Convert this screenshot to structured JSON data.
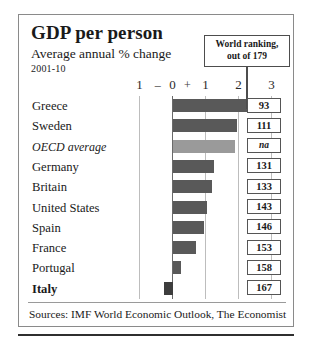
{
  "chart_data": {
    "type": "bar",
    "orientation": "horizontal",
    "title": "GDP per person",
    "subtitle": "Average annual % change",
    "period": "2001-10",
    "xlabel": "",
    "ylabel": "",
    "xlim": [
      -1,
      3
    ],
    "grid": true,
    "axis_ticks": [
      {
        "label": "1",
        "value": -1
      },
      {
        "label": "0",
        "value": 0
      },
      {
        "label": "1",
        "value": 1
      },
      {
        "label": "2",
        "value": 2
      },
      {
        "label": "3",
        "value": 3
      }
    ],
    "axis_signs": [
      {
        "label": "–",
        "value": -0.45
      },
      {
        "label": "+",
        "value": 0.45
      }
    ],
    "categories": [
      "Greece",
      "Sweden",
      "OECD average",
      "Germany",
      "Britain",
      "United States",
      "Spain",
      "France",
      "Portugal",
      "Italy"
    ],
    "values": [
      2.6,
      1.95,
      1.9,
      1.25,
      1.2,
      1.05,
      0.95,
      0.7,
      0.25,
      -0.25
    ],
    "ranking_label": "World ranking,\nout of 179",
    "rankings": [
      "93",
      "111",
      "na",
      "131",
      "133",
      "143",
      "146",
      "153",
      "158",
      "167"
    ],
    "source": "Sources: IMF World Economic Outlook, The Economist",
    "colors": {
      "bar_default": "#595959",
      "bar_highlight": "#9a9a9a",
      "bar_negative": "#3d3d3d",
      "frame": "#8a8a8a",
      "gridline": "#bdbdbd",
      "zeroline": "#6a6a6a"
    }
  },
  "header": {
    "title": "GDP per person",
    "subtitle": "Average annual % change",
    "period": "2001-10"
  },
  "callout": {
    "line1": "World ranking,",
    "line2": "out of  179"
  },
  "rows": [
    {
      "label": "Greece",
      "value": 2.6,
      "rank": "93",
      "style": "normal",
      "bar": "default"
    },
    {
      "label": "Sweden",
      "value": 1.95,
      "rank": "111",
      "style": "normal",
      "bar": "default"
    },
    {
      "label": "OECD average",
      "value": 1.9,
      "rank": "na",
      "style": "italic",
      "bar": "light"
    },
    {
      "label": "Germany",
      "value": 1.25,
      "rank": "131",
      "style": "normal",
      "bar": "default"
    },
    {
      "label": "Britain",
      "value": 1.2,
      "rank": "133",
      "style": "normal",
      "bar": "default"
    },
    {
      "label": "United States",
      "value": 1.05,
      "rank": "143",
      "style": "normal",
      "bar": "default"
    },
    {
      "label": "Spain",
      "value": 0.95,
      "rank": "146",
      "style": "normal",
      "bar": "default"
    },
    {
      "label": "France",
      "value": 0.7,
      "rank": "153",
      "style": "normal",
      "bar": "default"
    },
    {
      "label": "Portugal",
      "value": 0.25,
      "rank": "158",
      "style": "normal",
      "bar": "default"
    },
    {
      "label": "Italy",
      "value": -0.25,
      "rank": "167",
      "style": "bold",
      "bar": "dark"
    }
  ],
  "footer": {
    "source": "Sources: IMF World Economic Outlook, The Economist"
  }
}
